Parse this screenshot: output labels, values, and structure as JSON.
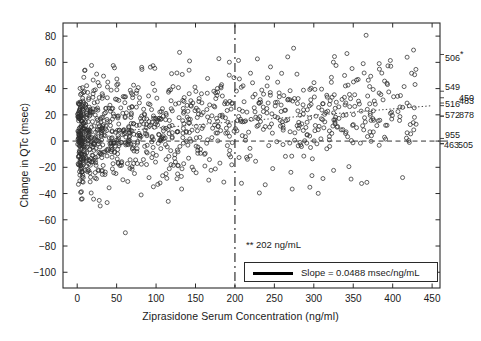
{
  "chart_data": {
    "type": "scatter",
    "title": "",
    "xlabel": "Ziprasidone Serum Concentration (ng/ml)",
    "ylabel": "Change in QTc (msec)",
    "xlim": [
      -18,
      460
    ],
    "ylim": [
      -112,
      90
    ],
    "xticks": [
      0,
      50,
      100,
      150,
      200,
      250,
      300,
      350,
      400,
      450
    ],
    "yticks": [
      80,
      60,
      40,
      20,
      0,
      -20,
      -40,
      -60,
      -80,
      -100
    ],
    "grid": false,
    "legend_position": "bottom-right",
    "n_points": 1100,
    "series": [
      {
        "name": "Subjects",
        "marker": "open-circle",
        "marker_size_px": 3.2,
        "description": "Change in QTc (msec) versus ziprasidone serum concentration (ng/ml); dense cluster below 200 ng/ml, sparse tail to 430 ng/ml",
        "distribution": {
          "x_mode_ng_ml": 20,
          "x_max_ng_ml": 430,
          "y_mean_at_0": 5.0,
          "y_sd": 19.5,
          "slope_msec_per_ng_per_ml": 0.0488
        }
      }
    ],
    "reference_lines": [
      {
        "name": "regression-line",
        "style": "dotted",
        "orientation": "sloped",
        "intercept_msec": 5.0,
        "slope_msec_per_ng_per_ml": 0.0488,
        "x_from": 0,
        "x_to": 450
      },
      {
        "name": "zero-reference-line",
        "style": "dashed",
        "orientation": "horizontal",
        "y_value_msec": 0
      },
      {
        "name": "concentration-threshold-line",
        "style": "dash-dot",
        "orientation": "vertical",
        "x_value_ng_ml": 200,
        "label": "** 202 ng/mL"
      }
    ],
    "annotations": [
      {
        "name": "threshold-annotation",
        "text": "** 202 ng/mL"
      }
    ],
    "legend": [
      {
        "text": "Slope = 0.0488 msec/ng/mL",
        "style": "solid-line"
      }
    ],
    "right_margin_labels": [
      {
        "text": "506",
        "superscript": "*",
        "y_msec": 66
      },
      {
        "text": "549",
        "y_msec": 38
      },
      {
        "text": "450",
        "y_msec": 33
      },
      {
        "text": "516",
        "y_msec": 27
      },
      {
        "text": "483",
        "y_msec": 29
      },
      {
        "text": "572",
        "y_msec": 19
      },
      {
        "text": "878",
        "y_msec": 19
      },
      {
        "text": "955",
        "y_msec": 2
      },
      {
        "text": "463",
        "y_msec": -2
      },
      {
        "text": "505",
        "y_msec": -2
      }
    ]
  },
  "axes": {
    "xlabel": "Ziprasidone Serum Concentration (ng/ml)",
    "ylabel": "Change in QTc (msec)",
    "xticklabels": [
      "0",
      "50",
      "100",
      "150",
      "200",
      "250",
      "300",
      "350",
      "400",
      "450"
    ],
    "yticklabels": [
      "80",
      "60",
      "40",
      "20",
      "0",
      "−20",
      "−40",
      "−60",
      "−80",
      "−100"
    ]
  },
  "annotation": {
    "threshold": "** 202 ng/mL"
  },
  "legend": {
    "slope_text": "Slope = 0.0488 msec/ng/mL"
  },
  "colors": {
    "ink": "#1a1a1a",
    "marker": "#3a3a3a",
    "background": "#ffffff"
  }
}
